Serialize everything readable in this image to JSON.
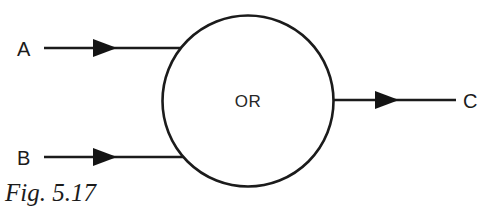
{
  "figure": {
    "caption": "Fig. 5.17",
    "background_color": "#ffffff",
    "ink_color": "#1b1b1b"
  },
  "gate": {
    "shape": "circle",
    "label": "OR",
    "center_x": 248,
    "center_y": 101,
    "radius": 86,
    "stroke_width": 2.6,
    "fill": "#ffffff"
  },
  "inputs": [
    {
      "label": "A",
      "label_x": 17,
      "label_y": 56,
      "line_y": 48,
      "line_start_x": 44,
      "line_end_x": 186,
      "arrow_tip_x": 117,
      "arrow_back_x": 93,
      "arrow_half_height": 9,
      "icon": "arrowhead-right-icon"
    },
    {
      "label": "B",
      "label_x": 17,
      "label_y": 165,
      "line_y": 157,
      "line_start_x": 44,
      "line_end_x": 184,
      "arrow_tip_x": 117,
      "arrow_back_x": 93,
      "arrow_half_height": 9,
      "icon": "arrowhead-right-icon"
    }
  ],
  "output": {
    "label": "C",
    "label_x": 463,
    "label_y": 108,
    "line_y": 100,
    "line_start_x": 333,
    "line_end_x": 456,
    "arrow_tip_x": 399,
    "arrow_back_x": 375,
    "arrow_half_height": 9,
    "icon": "arrowhead-right-icon"
  },
  "caption": {
    "text": "Fig. 5.17",
    "x": 5,
    "y": 201
  },
  "diagram_meta": {
    "type": "logic-gate-block-diagram",
    "gate_function": "OR",
    "input_count": 2,
    "output_count": 1,
    "input_names": "A, B",
    "output_name": "C"
  }
}
